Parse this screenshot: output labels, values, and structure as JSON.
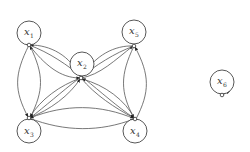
{
  "diagram": {
    "type": "directed-graph",
    "nodes": [
      {
        "id": "x1",
        "label": "x",
        "subscript": "1",
        "cx": 29,
        "cy": 33,
        "port": [
          29,
          45
        ]
      },
      {
        "id": "x2",
        "label": "x",
        "subscript": "2",
        "cx": 82,
        "cy": 64,
        "port": [
          81,
          78
        ]
      },
      {
        "id": "x3",
        "label": "x",
        "subscript": "3",
        "cx": 29,
        "cy": 131,
        "port": [
          29,
          118
        ]
      },
      {
        "id": "x4",
        "label": "x",
        "subscript": "4",
        "cx": 135,
        "cy": 131,
        "port": [
          135,
          119
        ]
      },
      {
        "id": "x5",
        "label": "x",
        "subscript": "5",
        "cx": 134,
        "cy": 32,
        "port": [
          134,
          46
        ]
      },
      {
        "id": "x6",
        "label": "x",
        "subscript": "6",
        "cx": 222,
        "cy": 82,
        "port": [
          222,
          95
        ]
      }
    ],
    "edges": [
      {
        "from": "x1",
        "to": "x3"
      },
      {
        "from": "x3",
        "to": "x1"
      },
      {
        "from": "x3",
        "to": "x4"
      },
      {
        "from": "x4",
        "to": "x3"
      },
      {
        "from": "x5",
        "to": "x4"
      },
      {
        "from": "x4",
        "to": "x5"
      },
      {
        "from": "x2",
        "to": "x1"
      },
      {
        "from": "x1",
        "to": "x2"
      },
      {
        "from": "x2",
        "to": "x5"
      },
      {
        "from": "x5",
        "to": "x2"
      },
      {
        "from": "x2",
        "to": "x3"
      },
      {
        "from": "x3",
        "to": "x2"
      },
      {
        "from": "x2",
        "to": "x4"
      },
      {
        "from": "x4",
        "to": "x2"
      },
      {
        "from": "x1",
        "to": "x4"
      },
      {
        "from": "x5",
        "to": "x3"
      },
      {
        "from": "x6",
        "to": "x6"
      }
    ]
  }
}
